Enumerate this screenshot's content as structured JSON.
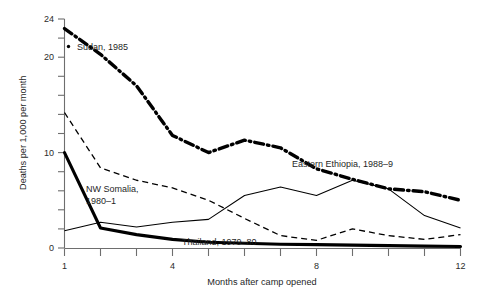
{
  "chart_data": {
    "type": "line",
    "title": "",
    "xlabel": "Months after camp opened",
    "ylabel": "Deaths per 1,000 per month",
    "xlim": [
      1,
      12
    ],
    "ylim": [
      0,
      24
    ],
    "grid": false,
    "legend_position": "inline-annotations",
    "x": [
      1,
      2,
      3,
      4,
      5,
      6,
      7,
      8,
      9,
      10,
      11,
      12
    ],
    "x_ticks": [
      1,
      2,
      3,
      4,
      5,
      6,
      7,
      8,
      9,
      10,
      11,
      12
    ],
    "x_tick_labels": [
      "1",
      "",
      "",
      "4",
      "",
      "",
      "",
      "8",
      "",
      "",
      "",
      "12"
    ],
    "y_ticks": [
      0,
      2,
      4,
      6,
      8,
      10,
      12,
      14,
      16,
      18,
      20,
      22,
      24
    ],
    "y_tick_labels": [
      "0",
      "",
      "",
      "",
      "",
      "10",
      "",
      "",
      "",
      "",
      "20",
      "",
      "24"
    ],
    "series": [
      {
        "name": "Sudan, 1985",
        "style": "thick dash-dot",
        "values": [
          23.0,
          20.3,
          17.0,
          11.8,
          10.0,
          11.3,
          10.5,
          8.3,
          7.2,
          6.2,
          5.9,
          5.0
        ]
      },
      {
        "name": "NW Somalia, 1980-1",
        "style": "thin dashed",
        "values": [
          14.2,
          8.4,
          7.1,
          6.3,
          5.0,
          3.1,
          1.3,
          0.8,
          2.0,
          1.3,
          0.9,
          1.4
        ]
      },
      {
        "name": "Eastern Ethiopia, 1988-9",
        "style": "thin solid",
        "values": [
          1.8,
          2.7,
          2.2,
          2.7,
          3.0,
          5.5,
          6.4,
          5.5,
          7.1,
          6.2,
          3.4,
          2.1
        ]
      },
      {
        "name": "Thailand, 1979-80",
        "style": "thick solid",
        "values": [
          10.0,
          2.1,
          1.4,
          0.9,
          0.6,
          0.5,
          0.4,
          0.35,
          0.3,
          0.25,
          0.2,
          0.15
        ]
      }
    ],
    "annotations": [
      {
        "text": "Sudan, 1985",
        "has_dot_marker": true
      },
      {
        "text": "NW Somalia,",
        "has_dot_marker": false
      },
      {
        "text": "1980–1",
        "has_dot_marker": false
      },
      {
        "text": "Eastern Ethiopia, 1988–9",
        "has_dot_marker": false
      },
      {
        "text": "Thailand, 1979–80",
        "has_dot_marker": false
      }
    ]
  },
  "labels": {
    "y_axis_title": "Deaths per 1,000 per month",
    "x_axis_title": "Months after camp opened",
    "y_0": "0",
    "y_10": "10",
    "y_20": "20",
    "y_24": "24",
    "x_1": "1",
    "x_4": "4",
    "x_8": "8",
    "x_12": "12",
    "sudan": "Sudan, 1985",
    "somalia_line1": "NW Somalia,",
    "somalia_line2": "1980–1",
    "ethiopia": "Eastern Ethiopia, 1988–9",
    "thailand": "Thailand, 1979–80"
  },
  "colors": {
    "ink": "#000000",
    "axis": "#6e6e6e",
    "text": "#1f1f1f",
    "background": "#ffffff"
  }
}
